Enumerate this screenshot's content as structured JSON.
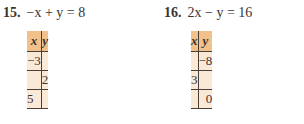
{
  "problems": [
    {
      "number": "15.",
      "equation": "−x + y = 8",
      "table": {
        "headers": [
          "x",
          "y"
        ],
        "rows": [
          {
            "x": "−3",
            "y": ""
          },
          {
            "x": "",
            "y": "2"
          },
          {
            "x": "5",
            "y": ""
          }
        ]
      }
    },
    {
      "number": "16.",
      "equation": "2x − y = 16",
      "table": {
        "headers": [
          "x",
          "y"
        ],
        "rows": [
          {
            "x": "",
            "y": "−8"
          },
          {
            "x": "3",
            "y": ""
          },
          {
            "x": "",
            "y": "0"
          }
        ]
      }
    }
  ],
  "colors": {
    "header_bg": "#f2c08a",
    "body_bg": "#fbe9d8",
    "rule": "#4a4038"
  }
}
